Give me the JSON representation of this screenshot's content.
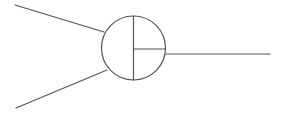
{
  "diagram": {
    "title": "",
    "symbol": "circle-quadrant-junction",
    "stroke_color": "#555555",
    "background_color": "#ffffff",
    "inputs": [
      {
        "name": "input-1"
      },
      {
        "name": "input-2"
      }
    ],
    "outputs": [
      {
        "name": "output-1"
      }
    ]
  }
}
